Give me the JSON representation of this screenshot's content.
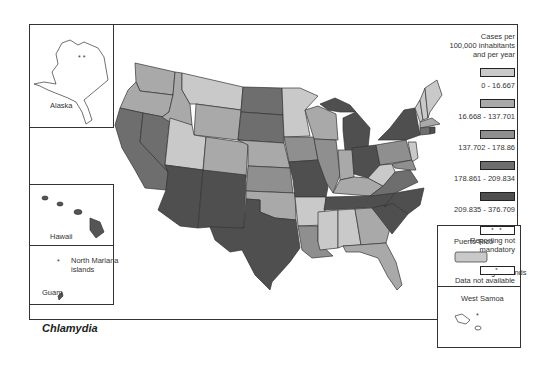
{
  "map": {
    "title": "Chlamydia",
    "insets": {
      "alaska": {
        "label": "Alaska",
        "marker": "* *"
      },
      "hawaii": {
        "label": "Hawaii"
      },
      "north_mariana": {
        "label_line1": "North Mariana",
        "label_line2": "islands",
        "marker": "*"
      },
      "guam": {
        "label": "Guam"
      },
      "puerto_rico": {
        "label": "Puerto Rico"
      },
      "virgin_islands": {
        "label": "Virgin islands"
      },
      "west_samoa": {
        "label": "West Samoa",
        "marker": "*"
      }
    }
  },
  "legend": {
    "title_line1": "Cases per",
    "title_line2": "100,000 inhabitants",
    "title_line3": "and per year",
    "classes": [
      {
        "range": "0 - 16.667",
        "color": "#c9c9c9"
      },
      {
        "range": "16.668 - 137.701",
        "color": "#a9a9a9"
      },
      {
        "range": "137.702 - 178.86",
        "color": "#8f8f8f"
      },
      {
        "range": "178.861 - 209.834",
        "color": "#6e6e6e"
      },
      {
        "range": "209.835 - 376.709",
        "color": "#4f4f4f"
      }
    ],
    "reporting_not_mandatory": {
      "label": "Reporting not mandatory",
      "marker": "* *"
    },
    "data_not_available": {
      "label": "Data not available",
      "marker": "*"
    }
  },
  "colors": {
    "c1": "#c9c9c9",
    "c2": "#a9a9a9",
    "c3": "#8f8f8f",
    "c4": "#6e6e6e",
    "c5": "#4f4f4f",
    "border": "#333333"
  }
}
